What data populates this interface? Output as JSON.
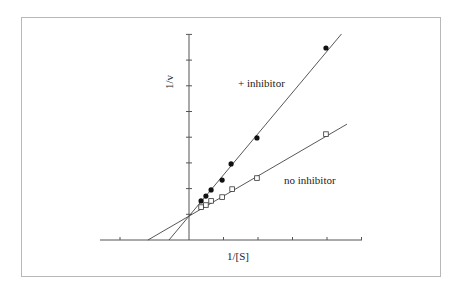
{
  "chart_data": {
    "type": "scatter",
    "title": "",
    "xlabel": "1/[S]",
    "ylabel": "1/v",
    "grid": false,
    "legend": "inline labels",
    "xlim": [
      -2.5,
      5.1
    ],
    "ylim": [
      0,
      8
    ],
    "x_ticks": [
      -2,
      -1,
      0,
      1,
      2,
      3,
      4,
      5
    ],
    "y_ticks": [
      1,
      2,
      3,
      4,
      5,
      6,
      7,
      8
    ],
    "tick_labels_shown": false,
    "series": [
      {
        "name": "+ inhibitor",
        "marker": "filled-circle",
        "x": [
          0.35,
          0.49,
          0.64,
          0.96,
          1.22,
          1.97,
          3.97
        ],
        "y": [
          1.52,
          1.71,
          1.95,
          2.33,
          2.96,
          3.97,
          7.47
        ],
        "fit_line": {
          "y_intercept": 0.93,
          "x_intercept": -0.58
        }
      },
      {
        "name": "no inhibitor",
        "marker": "open-square",
        "x": [
          0.35,
          0.49,
          0.64,
          0.96,
          1.25,
          1.97,
          3.97
        ],
        "y": [
          1.28,
          1.36,
          1.52,
          1.67,
          1.98,
          2.41,
          4.12
        ],
        "fit_line": {
          "y_intercept": 0.93,
          "x_intercept": -1.19
        }
      }
    ],
    "annotations": [
      {
        "text": "+ inhibitor",
        "x": 1.4,
        "y": 6.1
      },
      {
        "text": "no inhibitor",
        "x": 2.75,
        "y": 2.25
      }
    ]
  },
  "labels": {
    "xlabel": "1/[S]",
    "ylabel": "1/v",
    "inhibitor": "+ inhibitor",
    "no_inhibitor": "no inhibitor"
  }
}
